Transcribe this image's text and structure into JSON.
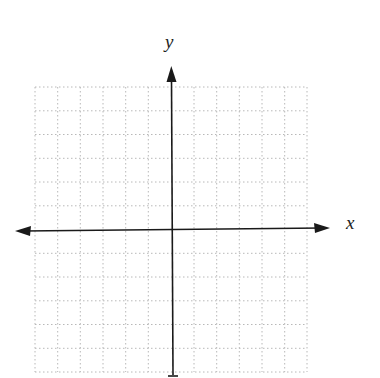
{
  "diagram": {
    "type": "coordinate-plane",
    "axes": {
      "x_label": "x",
      "y_label": "y"
    },
    "grid": {
      "columns": 12,
      "rows": 12,
      "style": "dotted",
      "color": "#b8b8b8"
    },
    "axis_color": "#1a1a1a"
  }
}
